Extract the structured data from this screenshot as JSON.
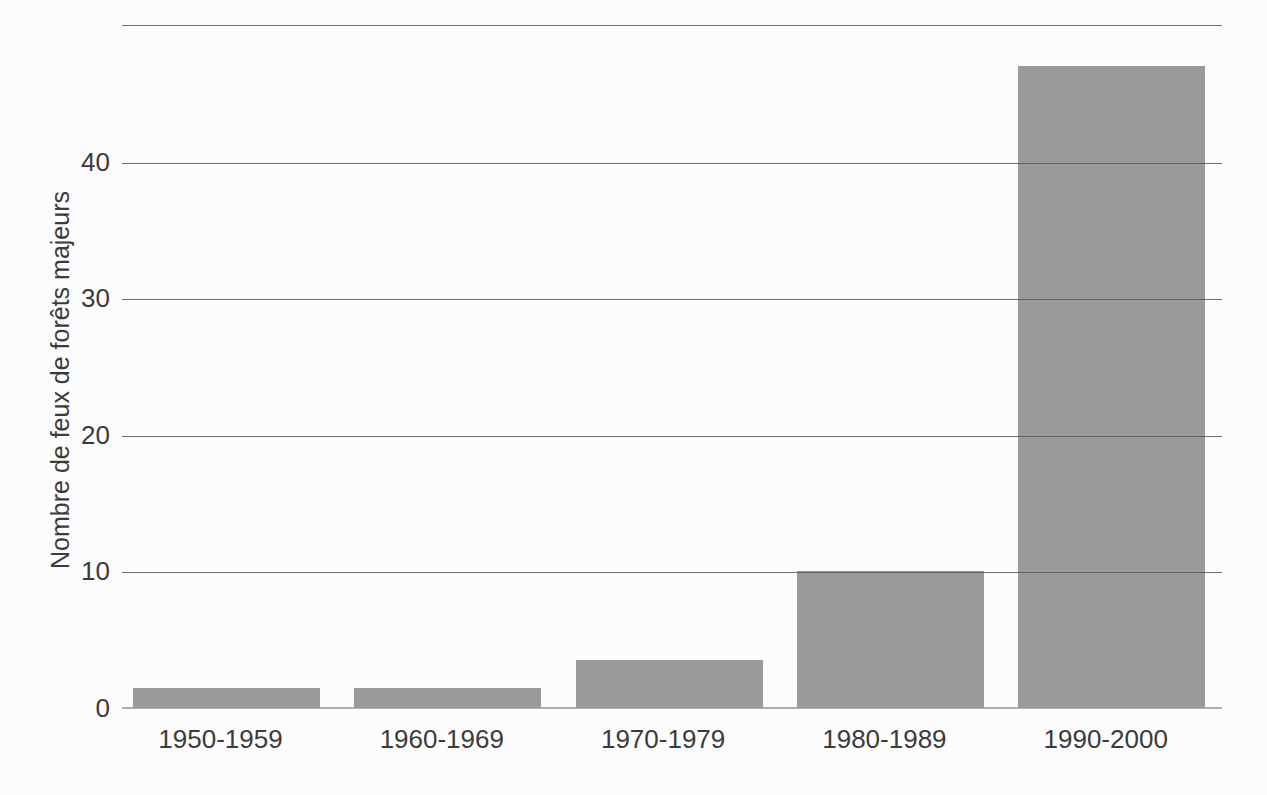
{
  "chart_data": {
    "type": "bar",
    "title": "",
    "categories": [
      "1950-1959",
      "1960-1969",
      "1970-1979",
      "1980-1989",
      "1990-2000"
    ],
    "values": [
      1.5,
      1.5,
      3.5,
      10,
      47
    ],
    "xlabel": "",
    "ylabel": "Nombre de feux de forêts majeurs",
    "yticks": [
      0,
      10,
      20,
      30,
      40
    ],
    "ylim": [
      0,
      50
    ],
    "grid": "horizontal-gridlines-over-bars",
    "legend": "none",
    "bar_color": "#9a9a9a",
    "gridline_color": "#565656",
    "baseline_color": "#aeaeae",
    "axis_text_color": "#3b3b3b",
    "background_color": "#fcfcfc"
  }
}
